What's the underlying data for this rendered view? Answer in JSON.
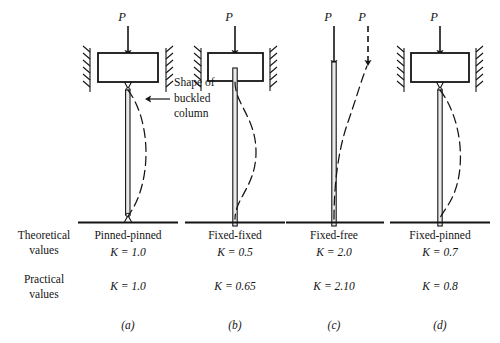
{
  "figure": {
    "caption_row_labels": {
      "theoretical": "Theoretical\nvalues",
      "theoretical_line1": "Theoretical",
      "theoretical_line2": "values",
      "practical_line1": "Practical",
      "practical_line2": "values"
    },
    "annotation": {
      "line1": "Shape of",
      "line2": "buckled",
      "line3": "column"
    },
    "columns": [
      {
        "id": "pinned-pinned",
        "name": "Pinned-pinned",
        "theoretical_k": "K = 1.0",
        "practical_k": "K = 1.0",
        "subfig": "(a)",
        "load_labels": [
          "P"
        ],
        "top_condition": "guided-fixed-block",
        "bottom_condition": "pin",
        "center_x": 128
      },
      {
        "id": "fixed-fixed",
        "name": "Fixed-fixed",
        "theoretical_k": "K = 0.5",
        "practical_k": "K = 0.65",
        "subfig": "(b)",
        "load_labels": [
          "P"
        ],
        "top_condition": "guided-fixed-block",
        "bottom_condition": "fixed",
        "center_x": 235
      },
      {
        "id": "fixed-free",
        "name": "Fixed-free",
        "theoretical_k": "K = 2.0",
        "practical_k": "K = 2.10",
        "subfig": "(c)",
        "load_labels": [
          "P",
          "P"
        ],
        "top_condition": "free",
        "bottom_condition": "fixed",
        "center_x": 334
      },
      {
        "id": "fixed-pinned",
        "name": "Fixed-pinned",
        "theoretical_k": "K = 0.7",
        "practical_k": "K = 0.8",
        "subfig": "(d)",
        "load_labels": [
          "P"
        ],
        "top_condition": "guided-fixed-block",
        "bottom_condition": "fixed",
        "center_x": 440
      }
    ],
    "colors": {
      "ink": "#141414",
      "line": "#1a1a1a",
      "background": "#ffffff",
      "shaft_fill": "#e9e9e9"
    }
  }
}
